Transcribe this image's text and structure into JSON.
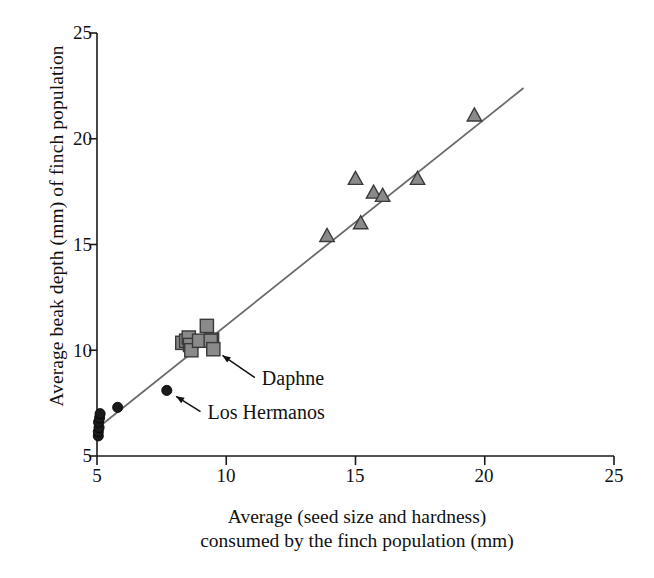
{
  "chart_data": {
    "type": "scatter",
    "title": "",
    "xlabel": "Average (seed size and hardness) consumed by the finch population (mm)",
    "xlabel_line1": "Average (seed size and hardness)",
    "xlabel_line2": "consumed by the finch population (mm)",
    "ylabel": "Average beak depth (mm) of finch population",
    "xlim": [
      5,
      25
    ],
    "ylim": [
      5,
      25
    ],
    "xticks": [
      5,
      10,
      15,
      20,
      25
    ],
    "yticks": [
      5,
      10,
      15,
      20,
      25
    ],
    "xtick_labels": [
      "5",
      "10",
      "15",
      "20",
      "25"
    ],
    "ytick_labels": [
      "5",
      "10",
      "15",
      "20",
      "25"
    ],
    "grid": false,
    "legend": "none",
    "series": [
      {
        "name": "small-seed finch populations",
        "marker": "circle",
        "color": "#1a1a1a",
        "edge_color": "#000000",
        "points": [
          [
            5.05,
            5.95
          ],
          [
            5.05,
            6.15
          ],
          [
            5.08,
            6.35
          ],
          [
            5.06,
            6.6
          ],
          [
            5.1,
            6.8
          ],
          [
            5.12,
            7.0
          ],
          [
            5.8,
            7.3
          ],
          [
            7.7,
            8.1
          ]
        ]
      },
      {
        "name": "medium-seed finch populations",
        "marker": "square",
        "color": "#8a8a8a",
        "edge_color": "#3a3a3a",
        "points": [
          [
            8.3,
            10.35
          ],
          [
            8.45,
            10.45
          ],
          [
            8.55,
            10.6
          ],
          [
            8.6,
            10.25
          ],
          [
            8.65,
            10.0
          ],
          [
            8.95,
            10.45
          ],
          [
            9.25,
            11.15
          ],
          [
            9.45,
            10.5
          ],
          [
            9.4,
            10.45
          ],
          [
            9.5,
            10.05
          ]
        ]
      },
      {
        "name": "large-seed finch populations",
        "marker": "triangle",
        "color": "#8a8a8a",
        "edge_color": "#3a3a3a",
        "points": [
          [
            13.9,
            15.4
          ],
          [
            15.0,
            18.1
          ],
          [
            15.2,
            16.0
          ],
          [
            15.7,
            17.45
          ],
          [
            16.05,
            17.3
          ],
          [
            17.4,
            18.1
          ],
          [
            19.6,
            21.1
          ]
        ]
      }
    ],
    "trendline": {
      "name": "regression-line",
      "color": "#6b6b6b",
      "x_start": 5.0,
      "y_start": 6.3,
      "x_end": 21.5,
      "y_end": 22.4
    },
    "annotations": [
      {
        "id": "daphne",
        "label": "Daphne",
        "target_x": 9.5,
        "target_y": 10.05,
        "text_x": 11.3,
        "text_y": 8.55
      },
      {
        "id": "los-hermanos",
        "label": "Los Hermanos",
        "target_x": 7.7,
        "target_y": 8.1,
        "text_x": 9.2,
        "text_y": 6.95
      }
    ]
  },
  "axes": {
    "y_title": "Average beak depth (mm) of finch population",
    "x_title_line1": "Average (seed size and hardness)",
    "x_title_line2": "consumed by the finch population (mm)"
  },
  "ticks": {
    "x": [
      "5",
      "10",
      "15",
      "20",
      "25"
    ],
    "y": [
      "25",
      "20",
      "15",
      "10",
      "5"
    ]
  },
  "annotations": {
    "daphne": "Daphne",
    "los_hermanos": "Los Hermanos"
  },
  "colors": {
    "axis": "#1a1a1a",
    "trendline": "#6b6b6b",
    "circle_fill": "#1a1a1a",
    "square_fill": "#8a8a8a",
    "square_edge": "#3a3a3a",
    "triangle_fill": "#8a8a8a",
    "triangle_edge": "#3a3a3a",
    "text": "#111111",
    "background": "#ffffff"
  }
}
